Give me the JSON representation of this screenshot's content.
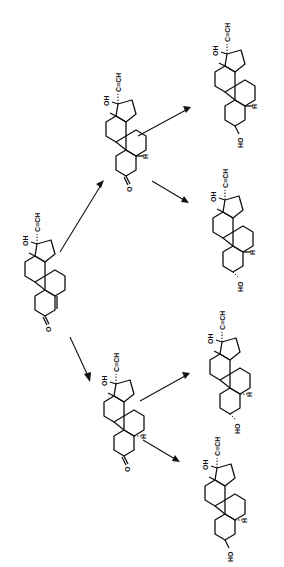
{
  "diagram": {
    "type": "reaction-scheme",
    "orientation": "rotated-90",
    "labels": {
      "ethynyl": "C≡CH",
      "hydroxyl_17": "OH",
      "hydrogen": "H",
      "hydroxyl_3": "HO",
      "ketone_o": "O"
    },
    "compounds": [
      {
        "id": "start",
        "name": "17α-ethynyl-3-keto steroid (Δ4)",
        "substituents": [
          "OH",
          "C≡CH",
          "O"
        ]
      },
      {
        "id": "ketone_5a",
        "name": "5α-dihydro 3-ketone",
        "substituents": [
          "OH",
          "C≡CH",
          "H",
          "O"
        ]
      },
      {
        "id": "ketone_5b",
        "name": "5β-dihydro 3-ketone",
        "substituents": [
          "OH",
          "C≡CH",
          "H",
          "O"
        ]
      },
      {
        "id": "diol_1",
        "name": "3β-hydroxy (from upper ketone)",
        "substituents": [
          "OH",
          "C≡CH",
          "H",
          "HO"
        ]
      },
      {
        "id": "diol_2",
        "name": "3α-hydroxy (from upper ketone)",
        "substituents": [
          "OH",
          "C≡CH",
          "H",
          "HO"
        ]
      },
      {
        "id": "diol_3",
        "name": "3α-hydroxy (from lower ketone)",
        "substituents": [
          "OH",
          "C≡CH",
          "H",
          "HO"
        ]
      },
      {
        "id": "diol_4",
        "name": "3β-hydroxy (from lower ketone)",
        "substituents": [
          "OH",
          "C≡CH",
          "H",
          "HO"
        ]
      }
    ],
    "arrows": [
      {
        "from": "start",
        "to": "ketone_5a"
      },
      {
        "from": "start",
        "to": "ketone_5b"
      },
      {
        "from": "ketone_5a",
        "to": "diol_1"
      },
      {
        "from": "ketone_5a",
        "to": "diol_2"
      },
      {
        "from": "ketone_5b",
        "to": "diol_3"
      },
      {
        "from": "ketone_5b",
        "to": "diol_4"
      }
    ]
  }
}
